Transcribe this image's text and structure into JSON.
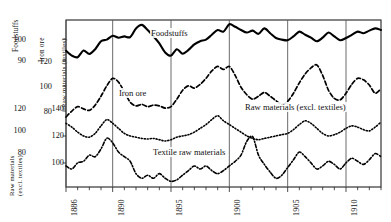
{
  "chart_data": {
    "type": "line",
    "title": "",
    "subtitle": "",
    "xlabel": "",
    "ylabel": "",
    "grid": true,
    "legend_position": "inline-annotations",
    "xlim": [
      1886,
      1913
    ],
    "x_tick_labels": [
      "1886",
      "1890",
      "1895",
      "1900",
      "1905",
      "1910"
    ],
    "x_tick_values": [
      1886,
      1890,
      1895,
      1900,
      1905,
      1910
    ],
    "x_minor_tick_interval": 1,
    "gridline_years": [
      1886,
      1890,
      1895,
      1900,
      1905,
      1910
    ],
    "axes": [
      {
        "name": "foodstuffs-axis",
        "title": "Foodstuffs",
        "ticks": [
          100,
          90
        ],
        "ylim": [
          85,
          105
        ]
      },
      {
        "name": "iron-ore-axis",
        "title": "Iron ore",
        "ticks": [
          120,
          100,
          80
        ],
        "ylim": [
          70,
          130
        ]
      },
      {
        "name": "raw-materials-textiles-axis",
        "title": "Raw materials (textiles)",
        "ticks": [
          140,
          120,
          100
        ],
        "ylim": [
          90,
          150
        ]
      },
      {
        "name": "raw-materials-excl-textiles-axis",
        "title": "Raw materials (excl. textiles)",
        "ticks": [
          120,
          100,
          80
        ],
        "ylim": [
          70,
          130
        ]
      }
    ],
    "series": [
      {
        "name": "Foodstuffs",
        "style": "solid-thick",
        "color": "#000000",
        "label_text": "Foodstuffs",
        "x": [
          1886,
          1886.5,
          1887,
          1887.5,
          1888,
          1888.5,
          1889,
          1889.5,
          1890,
          1890.5,
          1891,
          1891.5,
          1892,
          1892.5,
          1893,
          1893.5,
          1894,
          1894.5,
          1895,
          1895.5,
          1896,
          1896.5,
          1897,
          1897.5,
          1898,
          1898.5,
          1899,
          1899.5,
          1900,
          1900.5,
          1901,
          1901.5,
          1902,
          1902.5,
          1903,
          1903.5,
          1904,
          1904.5,
          1905,
          1905.5,
          1906,
          1906.5,
          1907,
          1907.5,
          1908,
          1908.5,
          1909,
          1909.5,
          1910,
          1910.5,
          1911,
          1911.5,
          1912,
          1912.5,
          1913
        ],
        "values": [
          94.5,
          93.0,
          92.5,
          94.6,
          93.5,
          95.0,
          97.5,
          98.0,
          99.2,
          98.6,
          99.0,
          98.8,
          101.5,
          102.6,
          101.0,
          99.0,
          96.8,
          94.0,
          93.0,
          95.0,
          93.6,
          94.8,
          96.5,
          97.5,
          98.0,
          99.5,
          101.0,
          100.5,
          102.8,
          102.0,
          101.0,
          100.2,
          100.8,
          99.8,
          101.5,
          100.0,
          98.5,
          98.0,
          97.8,
          99.0,
          100.5,
          99.5,
          98.6,
          97.5,
          98.6,
          100.2,
          99.0,
          97.8,
          98.5,
          99.5,
          100.5,
          100.0,
          100.8,
          101.5,
          101.0
        ]
      },
      {
        "name": "Iron ore",
        "style": "dashed",
        "color": "#000000",
        "label_text": "Iron ore",
        "x": [
          1886,
          1886.5,
          1887,
          1887.5,
          1888,
          1888.5,
          1889,
          1889.5,
          1890,
          1890.5,
          1891,
          1891.5,
          1892,
          1892.5,
          1893,
          1893.5,
          1894,
          1894.5,
          1895,
          1895.5,
          1896,
          1896.5,
          1897,
          1897.5,
          1898,
          1898.5,
          1899,
          1899.5,
          1900,
          1900.5,
          1901,
          1901.5,
          1902,
          1902.5,
          1903,
          1903.5,
          1904,
          1904.5,
          1905,
          1905.5,
          1906,
          1906.5,
          1907,
          1907.5,
          1908,
          1908.5,
          1909,
          1909.5,
          1910,
          1910.5,
          1911,
          1911.5,
          1912,
          1912.5,
          1913
        ],
        "values": [
          78.0,
          82.0,
          85.0,
          83.5,
          82.5,
          86.0,
          92.0,
          99.0,
          104.0,
          101.5,
          95.0,
          88.0,
          85.5,
          86.5,
          85.0,
          86.0,
          85.5,
          84.0,
          85.0,
          90.0,
          96.0,
          99.0,
          97.5,
          100.0,
          104.0,
          109.0,
          112.0,
          110.0,
          112.0,
          106.0,
          98.0,
          93.0,
          90.0,
          92.0,
          94.5,
          92.0,
          89.0,
          86.5,
          88.5,
          94.0,
          101.0,
          107.0,
          111.0,
          113.0,
          106.0,
          96.0,
          90.5,
          89.5,
          94.0,
          100.0,
          104.0,
          103.0,
          99.5,
          94.0,
          97.0
        ]
      },
      {
        "name": "Raw materials (excl. textiles)",
        "style": "dotted",
        "color": "#000000",
        "label_text": "Raw materials (excl. textiles)",
        "x": [
          1886,
          1886.5,
          1887,
          1887.5,
          1888,
          1888.5,
          1889,
          1889.5,
          1890,
          1890.5,
          1891,
          1891.5,
          1892,
          1892.5,
          1893,
          1893.5,
          1894,
          1894.5,
          1895,
          1895.5,
          1896,
          1896.5,
          1897,
          1897.5,
          1898,
          1898.5,
          1899,
          1899.5,
          1900,
          1900.5,
          1901,
          1901.5,
          1902,
          1902.5,
          1903,
          1903.5,
          1904,
          1904.5,
          1905,
          1905.5,
          1906,
          1906.5,
          1907,
          1907.5,
          1908,
          1908.5,
          1909,
          1909.5,
          1910,
          1910.5,
          1911,
          1911.5,
          1912,
          1912.5,
          1913
        ],
        "values": [
          128.0,
          126.5,
          124.5,
          123.0,
          122.5,
          124.0,
          127.0,
          129.5,
          128.0,
          126.0,
          124.0,
          123.0,
          122.5,
          122.0,
          121.8,
          122.0,
          121.5,
          121.0,
          121.5,
          122.5,
          123.0,
          123.5,
          124.5,
          126.0,
          127.5,
          129.5,
          131.0,
          129.0,
          127.5,
          126.0,
          124.5,
          123.0,
          122.0,
          121.5,
          122.0,
          122.5,
          123.0,
          123.5,
          124.0,
          125.5,
          127.5,
          129.0,
          128.0,
          126.0,
          124.0,
          123.0,
          123.5,
          124.5,
          126.0,
          127.0,
          126.5,
          125.5,
          125.0,
          126.5,
          128.5
        ]
      },
      {
        "name": "Textile raw materials",
        "style": "dash-dot",
        "color": "#000000",
        "label_text": "Textile raw materials",
        "x": [
          1886,
          1886.5,
          1887,
          1887.5,
          1888,
          1888.5,
          1889,
          1889.5,
          1890,
          1890.5,
          1891,
          1891.5,
          1892,
          1892.5,
          1893,
          1893.5,
          1894,
          1894.5,
          1895,
          1895.5,
          1896,
          1896.5,
          1897,
          1897.5,
          1898,
          1898.5,
          1899,
          1899.5,
          1900,
          1900.5,
          1901,
          1901.5,
          1902,
          1902.5,
          1903,
          1903.5,
          1904,
          1904.5,
          1905,
          1905.5,
          1906,
          1906.5,
          1907,
          1907.5,
          1908,
          1908.5,
          1909,
          1909.5,
          1910,
          1910.5,
          1911,
          1911.5,
          1912,
          1912.5,
          1913
        ],
        "values": [
          100.5,
          99.5,
          101.5,
          102.0,
          104.0,
          103.5,
          106.0,
          109.5,
          108.0,
          105.0,
          103.5,
          102.0,
          98.0,
          96.5,
          97.5,
          96.5,
          98.0,
          96.5,
          95.5,
          96.0,
          97.5,
          99.0,
          100.5,
          99.5,
          100.5,
          99.0,
          98.0,
          99.0,
          100.5,
          102.0,
          104.0,
          108.5,
          110.0,
          104.0,
          101.0,
          98.5,
          96.5,
          97.5,
          100.0,
          102.5,
          105.0,
          103.5,
          101.5,
          99.5,
          100.5,
          102.0,
          101.0,
          99.5,
          101.5,
          103.0,
          102.0,
          101.0,
          102.5,
          104.5,
          103.5
        ]
      }
    ],
    "annotations": [
      {
        "text": "Foodstuffs",
        "x_px": 150,
        "y_px": 30
      },
      {
        "text": "Iron ore",
        "x_px": 118,
        "y_px": 91
      },
      {
        "text": "Raw materials (excl. textiles)",
        "x_px": 244,
        "y_px": 105
      },
      {
        "text": "Textile raw materials",
        "x_px": 152,
        "y_px": 150
      }
    ]
  },
  "axis_columns": {
    "col1": {
      "title": "Foodstuffs",
      "title2": "Raw materials (excl. textiles)",
      "ticks": [
        "100",
        "90",
        "120",
        "100",
        "80"
      ]
    },
    "col2": {
      "title": "Iron ore",
      "ticks": [
        "120",
        "100",
        "80"
      ]
    },
    "col3": {
      "title": "Raw materials (textiles)",
      "ticks": [
        "140",
        "120",
        "100"
      ]
    }
  },
  "colors": {
    "ink": "#000000",
    "grid": "#5a5a5a",
    "frame": "#222222",
    "background": "#ffffff"
  }
}
